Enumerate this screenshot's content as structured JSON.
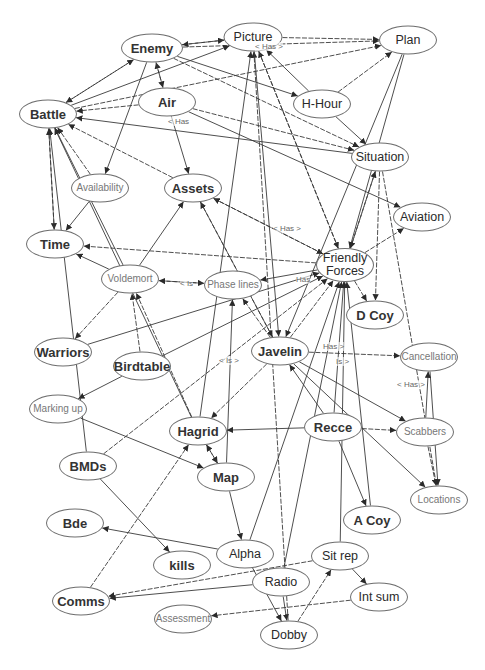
{
  "diagram": {
    "title": "",
    "colors": {
      "edge": "#3a3a3a",
      "node_border": "#6e6e6e",
      "label": "#666666"
    },
    "nodes": [
      {
        "id": "enemy",
        "label": "Enemy",
        "x": 152,
        "y": 48,
        "w": 58,
        "h": 27,
        "style": "bold"
      },
      {
        "id": "picture",
        "label": "Picture",
        "x": 253,
        "y": 37,
        "w": 55,
        "h": 27,
        "style": "normal"
      },
      {
        "id": "plan",
        "label": "Plan",
        "x": 408,
        "y": 40,
        "w": 54,
        "h": 27,
        "style": "normal"
      },
      {
        "id": "air",
        "label": "Air",
        "x": 167,
        "y": 102,
        "w": 54,
        "h": 27,
        "style": "bold"
      },
      {
        "id": "h-hour",
        "label": "H-Hour",
        "x": 322,
        "y": 104,
        "w": 54,
        "h": 27,
        "style": "normal"
      },
      {
        "id": "battle",
        "label": "Battle",
        "x": 48,
        "y": 114,
        "w": 54,
        "h": 27,
        "style": "bold"
      },
      {
        "id": "situation",
        "label": "Situation",
        "x": 380,
        "y": 157,
        "w": 54,
        "h": 27,
        "style": "normal"
      },
      {
        "id": "availability",
        "label": "Availability",
        "x": 100,
        "y": 188,
        "w": 54,
        "h": 27,
        "style": "light"
      },
      {
        "id": "assets",
        "label": "Assets",
        "x": 193,
        "y": 188,
        "w": 54,
        "h": 27,
        "style": "bold"
      },
      {
        "id": "aviation",
        "label": "Aviation",
        "x": 422,
        "y": 217,
        "w": 54,
        "h": 27,
        "style": "normal"
      },
      {
        "id": "time",
        "label": "Time",
        "x": 55,
        "y": 244,
        "w": 54,
        "h": 27,
        "style": "bold"
      },
      {
        "id": "friendly-forces",
        "label": "Friendly Forces",
        "x": 345,
        "y": 265,
        "w": 54,
        "h": 32,
        "style": "normal"
      },
      {
        "id": "voldemort",
        "label": "Voldemort",
        "x": 130,
        "y": 279,
        "w": 54,
        "h": 27,
        "style": "light"
      },
      {
        "id": "phase-lines",
        "label": "Phase lines",
        "x": 233,
        "y": 285,
        "w": 54,
        "h": 27,
        "style": "light"
      },
      {
        "id": "d-coy",
        "label": "D Coy",
        "x": 375,
        "y": 315,
        "w": 54,
        "h": 27,
        "style": "bold"
      },
      {
        "id": "warriors",
        "label": "Warriors",
        "x": 63,
        "y": 352,
        "w": 54,
        "h": 27,
        "style": "bold"
      },
      {
        "id": "birdtable",
        "label": "Birdtable",
        "x": 142,
        "y": 366,
        "w": 54,
        "h": 27,
        "style": "bold"
      },
      {
        "id": "javelin",
        "label": "Javelin",
        "x": 280,
        "y": 351,
        "w": 54,
        "h": 27,
        "style": "bold"
      },
      {
        "id": "cancellation",
        "label": "Cancellation",
        "x": 429,
        "y": 357,
        "w": 54,
        "h": 27,
        "style": "light"
      },
      {
        "id": "marking-up",
        "label": "Marking up",
        "x": 58,
        "y": 409,
        "w": 54,
        "h": 27,
        "style": "light"
      },
      {
        "id": "hagrid",
        "label": "Hagrid",
        "x": 198,
        "y": 431,
        "w": 54,
        "h": 27,
        "style": "bold"
      },
      {
        "id": "recce",
        "label": "Recce",
        "x": 333,
        "y": 427,
        "w": 54,
        "h": 27,
        "style": "bold"
      },
      {
        "id": "scabbers",
        "label": "Scabbers",
        "x": 425,
        "y": 432,
        "w": 54,
        "h": 27,
        "style": "light"
      },
      {
        "id": "bmds",
        "label": "BMDs",
        "x": 88,
        "y": 466,
        "w": 54,
        "h": 27,
        "style": "bold"
      },
      {
        "id": "map",
        "label": "Map",
        "x": 226,
        "y": 477,
        "w": 54,
        "h": 27,
        "style": "bold"
      },
      {
        "id": "locations",
        "label": "Locations",
        "x": 439,
        "y": 500,
        "w": 54,
        "h": 27,
        "style": "light"
      },
      {
        "id": "a-coy",
        "label": "A Coy",
        "x": 372,
        "y": 520,
        "w": 54,
        "h": 27,
        "style": "bold"
      },
      {
        "id": "bde",
        "label": "Bde",
        "x": 75,
        "y": 523,
        "w": 54,
        "h": 27,
        "style": "bold"
      },
      {
        "id": "alpha",
        "label": "Alpha",
        "x": 245,
        "y": 554,
        "w": 54,
        "h": 27,
        "style": "normal"
      },
      {
        "id": "sit-rep",
        "label": "Sit rep",
        "x": 340,
        "y": 556,
        "w": 54,
        "h": 27,
        "style": "normal"
      },
      {
        "id": "kills",
        "label": "kills",
        "x": 182,
        "y": 565,
        "w": 54,
        "h": 27,
        "style": "bold"
      },
      {
        "id": "radio",
        "label": "Radio",
        "x": 281,
        "y": 582,
        "w": 54,
        "h": 27,
        "style": "normal"
      },
      {
        "id": "comms",
        "label": "Comms",
        "x": 81,
        "y": 601,
        "w": 54,
        "h": 27,
        "style": "bold"
      },
      {
        "id": "int-sum",
        "label": "Int sum",
        "x": 379,
        "y": 597,
        "w": 54,
        "h": 27,
        "style": "normal"
      },
      {
        "id": "assessment",
        "label": "Assessment",
        "x": 183,
        "y": 619,
        "w": 54,
        "h": 27,
        "style": "light"
      },
      {
        "id": "dobby",
        "label": "Dobby",
        "x": 289,
        "y": 635,
        "w": 54,
        "h": 27,
        "style": "normal"
      }
    ],
    "edges": [
      [
        "enemy",
        "picture",
        1
      ],
      [
        "picture",
        "enemy",
        1
      ],
      [
        "enemy",
        "battle",
        1
      ],
      [
        "battle",
        "enemy",
        1
      ],
      [
        "air",
        "enemy",
        1
      ],
      [
        "enemy",
        "air",
        1
      ],
      [
        "enemy",
        "plan",
        0
      ],
      [
        "picture",
        "plan",
        1
      ],
      [
        "battle",
        "picture",
        0
      ],
      [
        "battle",
        "plan",
        0
      ],
      [
        "enemy",
        "h-hour",
        0
      ],
      [
        "h-hour",
        "picture",
        0
      ],
      [
        "h-hour",
        "plan",
        0
      ],
      [
        "h-hour",
        "situation",
        0
      ],
      [
        "air",
        "battle",
        1
      ],
      [
        "air",
        "situation",
        0
      ],
      [
        "air",
        "assets",
        0
      ],
      [
        "air",
        "aviation",
        0
      ],
      [
        "enemy",
        "situation",
        0
      ],
      [
        "battle",
        "time",
        1
      ],
      [
        "time",
        "battle",
        1
      ],
      [
        "availability",
        "battle",
        0
      ],
      [
        "availability",
        "time",
        0
      ],
      [
        "enemy",
        "availability",
        0
      ],
      [
        "assets",
        "battle",
        0
      ],
      [
        "situation",
        "battle",
        0
      ],
      [
        "situation",
        "friendly-forces",
        1
      ],
      [
        "friendly-forces",
        "situation",
        1
      ],
      [
        "friendly-forces",
        "picture",
        1
      ],
      [
        "picture",
        "friendly-forces",
        1
      ],
      [
        "friendly-forces",
        "time",
        0
      ],
      [
        "friendly-forces",
        "assets",
        1
      ],
      [
        "assets",
        "friendly-forces",
        1
      ],
      [
        "friendly-forces",
        "aviation",
        0
      ],
      [
        "plan",
        "friendly-forces",
        0
      ],
      [
        "plan",
        "javelin",
        0
      ],
      [
        "situation",
        "d-coy",
        0
      ],
      [
        "friendly-forces",
        "d-coy",
        1
      ],
      [
        "friendly-forces",
        "phase-lines",
        0
      ],
      [
        "voldemort",
        "phase-lines",
        1
      ],
      [
        "phase-lines",
        "voldemort",
        1
      ],
      [
        "voldemort",
        "time",
        0
      ],
      [
        "voldemort",
        "warriors",
        0
      ],
      [
        "voldemort",
        "battle",
        0
      ],
      [
        "voldemort",
        "assets",
        0
      ],
      [
        "birdtable",
        "voldemort",
        0
      ],
      [
        "birdtable",
        "marking-up",
        0
      ],
      [
        "birdtable",
        "friendly-forces",
        0
      ],
      [
        "hagrid",
        "voldemort",
        0
      ],
      [
        "hagrid",
        "battle",
        0
      ],
      [
        "hagrid",
        "picture",
        0
      ],
      [
        "javelin",
        "friendly-forces",
        1
      ],
      [
        "javelin",
        "assets",
        1
      ],
      [
        "javelin",
        "phase-lines",
        1
      ],
      [
        "javelin",
        "cancellation",
        0
      ],
      [
        "javelin",
        "scabbers",
        0
      ],
      [
        "javelin",
        "locations",
        0
      ],
      [
        "javelin",
        "hagrid",
        0
      ],
      [
        "recce",
        "friendly-forces",
        0
      ],
      [
        "recce",
        "hagrid",
        0
      ],
      [
        "recce",
        "scabbers",
        0
      ],
      [
        "recce",
        "a-coy",
        0
      ],
      [
        "recce",
        "javelin",
        0
      ],
      [
        "scabbers",
        "locations",
        0
      ],
      [
        "cancellation",
        "locations",
        0
      ],
      [
        "scabbers",
        "cancellation",
        0
      ],
      [
        "situation",
        "locations",
        0
      ],
      [
        "marking-up",
        "map",
        0
      ],
      [
        "bmds",
        "kills",
        0
      ],
      [
        "bmds",
        "friendly-forces",
        0
      ],
      [
        "bmds",
        "battle",
        0
      ],
      [
        "hagrid",
        "map",
        1
      ],
      [
        "map",
        "hagrid",
        1
      ],
      [
        "map",
        "alpha",
        0
      ],
      [
        "map",
        "phase-lines",
        0
      ],
      [
        "comms",
        "hagrid",
        0
      ],
      [
        "alpha",
        "bde",
        0
      ],
      [
        "alpha",
        "friendly-forces",
        0
      ],
      [
        "sit-rep",
        "comms",
        0
      ],
      [
        "radio",
        "comms",
        0
      ],
      [
        "sit-rep",
        "int-sum",
        0
      ],
      [
        "int-sum",
        "assessment",
        0
      ],
      [
        "radio",
        "dobby",
        0
      ],
      [
        "alpha",
        "dobby",
        0
      ],
      [
        "dobby",
        "sit-rep",
        0
      ],
      [
        "sit-rep",
        "friendly-forces",
        0
      ],
      [
        "radio",
        "friendly-forces",
        0
      ],
      [
        "dobby",
        "picture",
        0
      ],
      [
        "a-coy",
        "friendly-forces",
        0
      ],
      [
        "warriors",
        "friendly-forces",
        0
      ],
      [
        "assets",
        "javelin",
        0
      ],
      [
        "picture",
        "javelin",
        0
      ]
    ],
    "edge_labels": [
      {
        "text": "< Has >",
        "x": 255,
        "y": 47
      },
      {
        "text": "< Has",
        "x": 168,
        "y": 122
      },
      {
        "text": "< Has >",
        "x": 273,
        "y": 229
      },
      {
        "text": "< Is",
        "x": 180,
        "y": 284
      },
      {
        "text": "Has",
        "x": 296,
        "y": 280
      },
      {
        "text": "< Is >",
        "x": 219,
        "y": 361
      },
      {
        "text": "Has >",
        "x": 323,
        "y": 347
      },
      {
        "text": "Is >",
        "x": 336,
        "y": 362
      },
      {
        "text": "< Has >",
        "x": 397,
        "y": 385
      }
    ]
  }
}
